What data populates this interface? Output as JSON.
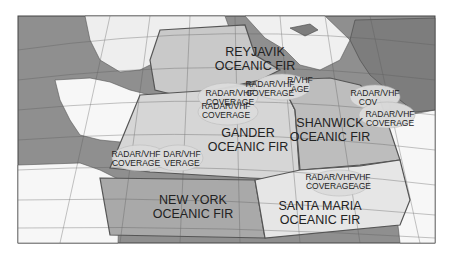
{
  "map": {
    "title": "North Atlantic Oceanic FIRs",
    "colors": {
      "ocean_grid": "#8f8f8f",
      "land": "#ffffff",
      "reykjavik_fir": "#c9c9c9",
      "gander_fir": "#d6d6d6",
      "shanwick_fir": "#bdbdbd",
      "new_york_fir": "#a9a9a9",
      "santa_maria_fir": "#e6e6e6",
      "coverage_ellipse": "#dcdcdc",
      "border": "#555555"
    },
    "firs": [
      {
        "line1": "REYJAVIK",
        "line2": "OCEANIC FIR"
      },
      {
        "line1": "GANDER",
        "line2": "OCEANIC FIR"
      },
      {
        "line1": "SHANWICK",
        "line2": "OCEANIC FIR"
      },
      {
        "line1": "NEW YORK",
        "line2": "OCEANIC FIR"
      },
      {
        "line1": "SANTA MARIA",
        "line2": "OCEANIC FIR"
      }
    ],
    "coverage": [
      {
        "line1": "RADAR/VHF",
        "line2": "COVERAGE"
      },
      {
        "line1": "R/VHF",
        "line2": "AGE"
      },
      {
        "line1": "RADAR/VHF",
        "line2": "COVERAGE"
      },
      {
        "line1": "RADAR/VHF",
        "line2": "COVERAGE"
      },
      {
        "line1": "RADAR/VHF",
        "line2": "COVERAGE"
      },
      {
        "line1": "RADAR/VHF",
        "line2": "COVERAGE"
      },
      {
        "line1": "DAR/VHF",
        "line2": "VERAGE"
      },
      {
        "line1": "RADAR/VHF",
        "line2": "COVERAGE"
      },
      {
        "line1": "VHF",
        "line2": "AGE"
      },
      {
        "line1": "RADAR/VHF",
        "line2": "COV"
      }
    ]
  }
}
